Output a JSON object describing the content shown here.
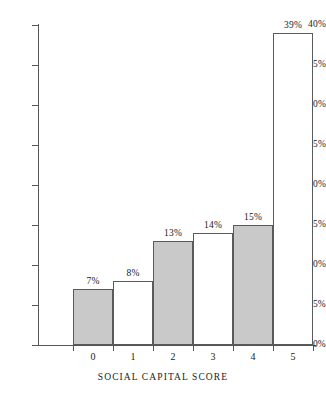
{
  "chart_data": {
    "type": "bar",
    "title": "",
    "xlabel": "SOCIAL CAPITAL SCORE",
    "ylabel": "",
    "categories": [
      "0",
      "1",
      "2",
      "3",
      "4",
      "5"
    ],
    "values": [
      7,
      8,
      13,
      14,
      15,
      39
    ],
    "value_labels": [
      "7%",
      "8%",
      "13%",
      "14%",
      "15%",
      "39%"
    ],
    "bar_styles": [
      "filled",
      "hollow",
      "filled",
      "hollow",
      "filled",
      "hollow"
    ],
    "ylim": [
      0,
      40
    ],
    "ytick_values": [
      0,
      5,
      10,
      15,
      20,
      25,
      30,
      35,
      40
    ],
    "ytick_labels": [
      "0%",
      "5%",
      "10%",
      "15%",
      "20%",
      "25%",
      "30%",
      "35%",
      "40%"
    ],
    "grid": false,
    "legend": null,
    "colors": {
      "bar_fill": "#c9c9c9",
      "bar_stroke": "#5a5a5a",
      "axis": "#555555",
      "text": "#1a1a1a",
      "background": "#ffffff"
    }
  }
}
